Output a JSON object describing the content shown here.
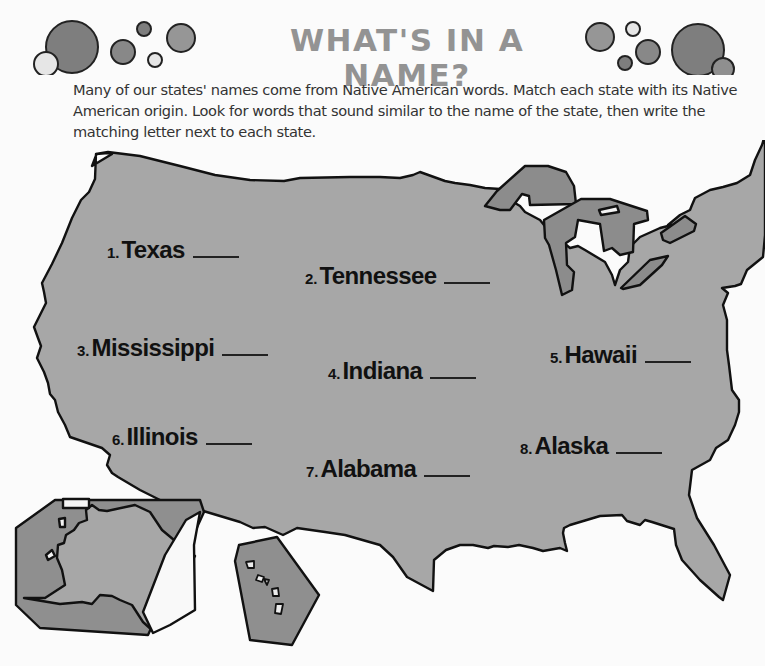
{
  "header": {
    "title": "WHAT'S IN A NAME?",
    "bubble_colors": {
      "dark": "#7e7e7e",
      "mid": "#969696",
      "light": "#e4e4e4",
      "stroke": "#222222"
    }
  },
  "intro": {
    "text": "Many of our states' names come from Native American words. Match each state with its Native American origin. Look for words that sound similar to the name of the state, then write the matching letter next to each state."
  },
  "map": {
    "land_color": "#a7a7a7",
    "lake_color": "#8c8c8c",
    "inset_color": "#8f8f8f",
    "outline_color": "#111111"
  },
  "items": [
    {
      "number": "1.",
      "state": "Texas",
      "answer": ""
    },
    {
      "number": "2.",
      "state": "Tennessee",
      "answer": ""
    },
    {
      "number": "3.",
      "state": "Mississippi",
      "answer": ""
    },
    {
      "number": "4.",
      "state": "Indiana",
      "answer": ""
    },
    {
      "number": "5.",
      "state": "Hawaii",
      "answer": ""
    },
    {
      "number": "6.",
      "state": "Illinois",
      "answer": ""
    },
    {
      "number": "7.",
      "state": "Alabama",
      "answer": ""
    },
    {
      "number": "8.",
      "state": "Alaska",
      "answer": ""
    }
  ]
}
